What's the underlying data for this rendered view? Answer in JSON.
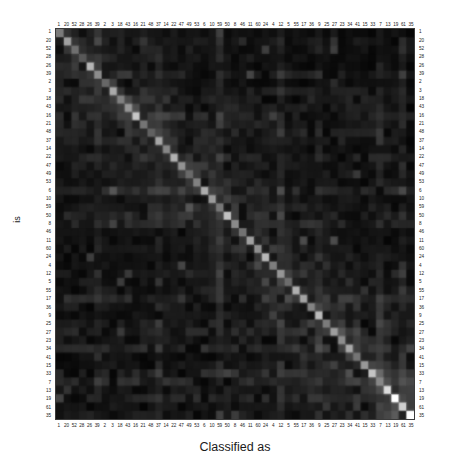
{
  "chart_data": {
    "type": "heatmap",
    "title": "",
    "subtitle": "",
    "xlabel": "Classified as",
    "ylabel": "is",
    "colormap": "grayscale",
    "colormap_low": "#000000",
    "colormap_high": "#ffffff",
    "grid": false,
    "legend": "none",
    "n_classes": 48,
    "categories": [
      "1",
      "20",
      "52",
      "28",
      "26",
      "39",
      "2",
      "3",
      "18",
      "43",
      "16",
      "21",
      "48",
      "37",
      "14",
      "22",
      "47",
      "49",
      "53",
      "6",
      "10",
      "59",
      "50",
      "8",
      "46",
      "11",
      "60",
      "24",
      "4",
      "12",
      "5",
      "55",
      "17",
      "36",
      "9",
      "25",
      "27",
      "23",
      "34",
      "41",
      "15",
      "33",
      "7",
      "13",
      "19",
      "61",
      "35",
      "45"
    ],
    "xtick_labels": [
      "1",
      "20",
      "52",
      "28",
      "26",
      "39",
      "2",
      "3",
      "18",
      "43",
      "16",
      "21",
      "48",
      "37",
      "14",
      "22",
      "47",
      "49",
      "53",
      "6",
      "10",
      "59",
      "50",
      "8",
      "46",
      "11",
      "60",
      "24",
      "4",
      "12",
      "5",
      "55",
      "17",
      "36",
      "9",
      "25",
      "27",
      "23",
      "34",
      "41",
      "15",
      "33",
      "7",
      "13",
      "19",
      "61",
      "35"
    ],
    "ytick_labels": [
      "1",
      "20",
      "52",
      "28",
      "26",
      "39",
      "2",
      "3",
      "18",
      "43",
      "16",
      "21",
      "48",
      "37",
      "14",
      "22",
      "47",
      "49",
      "53",
      "6",
      "10",
      "59",
      "50",
      "8",
      "46",
      "11",
      "60",
      "24",
      "4",
      "12",
      "5",
      "55",
      "17",
      "36",
      "9",
      "25",
      "27",
      "23",
      "34",
      "41",
      "15",
      "33",
      "7",
      "13",
      "19",
      "61",
      "35"
    ],
    "value_range": [
      0,
      1
    ],
    "diagonal_values": [
      0.42,
      0.55,
      0.38,
      0.3,
      0.62,
      0.48,
      0.35,
      0.58,
      0.44,
      0.52,
      0.68,
      0.4,
      0.33,
      0.57,
      0.46,
      0.61,
      0.5,
      0.36,
      0.44,
      0.59,
      0.53,
      0.41,
      0.66,
      0.47,
      0.39,
      0.55,
      0.49,
      0.63,
      0.43,
      0.51,
      0.37,
      0.6,
      0.56,
      0.45,
      0.64,
      0.42,
      0.54,
      0.48,
      0.58,
      0.4,
      0.52,
      0.67,
      0.46,
      0.75,
      0.88,
      0.71,
      0.95
    ]
  },
  "axes": {
    "x_title": "Classified as",
    "y_title": "is"
  }
}
